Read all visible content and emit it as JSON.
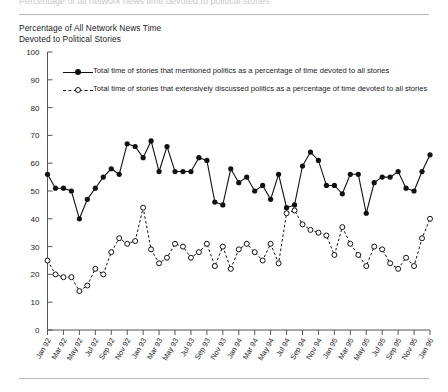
{
  "figure": {
    "clipped_header": "Percentage of all network news time devoted to political stories",
    "title": "Percentage of All Network News Time\nDevoted to Political Stories"
  },
  "chart_data": {
    "type": "line",
    "title": "Percentage of All Network News Time Devoted to Political Stories",
    "xlabel": "",
    "ylabel": "",
    "ylim": [
      0,
      100
    ],
    "ytick_step": 10,
    "yticks": [
      0,
      10,
      20,
      30,
      40,
      50,
      60,
      70,
      80,
      90,
      100
    ],
    "grid": false,
    "legend_position": "top-left",
    "x_tick_interval_months": 2,
    "x": [
      "Jan 92",
      "Feb 92",
      "Mar 92",
      "Apr 92",
      "May 92",
      "Jun 92",
      "Jul 92",
      "Aug 92",
      "Sep 92",
      "Oct 92",
      "Nov 92",
      "Dec 92",
      "Jan 93",
      "Feb 93",
      "Mar 93",
      "Apr 93",
      "May 93",
      "Jun 93",
      "Jul 93",
      "Aug 93",
      "Sep 93",
      "Oct 93",
      "Nov 93",
      "Dec 93",
      "Jan 94",
      "Feb 94",
      "Mar 94",
      "Apr 94",
      "May 94",
      "Jun 94",
      "Jul 94",
      "Aug 94",
      "Sep 94",
      "Oct 94",
      "Nov 94",
      "Dec 94",
      "Jan 95",
      "Feb 95",
      "Mar 95",
      "Apr 95",
      "May 95",
      "Jun 95",
      "Jul 95",
      "Aug 95",
      "Sep 95",
      "Oct 95",
      "Nov 95",
      "Dec 95",
      "Jan 96"
    ],
    "xticklabels": [
      "Jan 92",
      "Mar 92",
      "May 92",
      "Jul 92",
      "Sep 92",
      "Nov 92",
      "Jan 93",
      "Mar 93",
      "May 93",
      "Jul 93",
      "Sep 93",
      "Nov 93",
      "Jan 94",
      "Mar 94",
      "May 94",
      "Jul 94",
      "Sep 94",
      "Nov 94",
      "Jan 95",
      "Mar 95",
      "May 95",
      "Jul 95",
      "Sep 95",
      "Nov 95",
      "Jan 96"
    ],
    "series": [
      {
        "name": "Total time of stories that mentioned politics as a percentage of time devoted to all stories",
        "marker": "filled-circle",
        "linestyle": "solid",
        "values": [
          56,
          51,
          51,
          50,
          40,
          47,
          51,
          55,
          58,
          56,
          67,
          66,
          62,
          68,
          57,
          66,
          57,
          57,
          57,
          62,
          61,
          46,
          45,
          58,
          53,
          55,
          50,
          52,
          47,
          56,
          44,
          45,
          59,
          64,
          61,
          52,
          52,
          49,
          56,
          56,
          42,
          53,
          55,
          55,
          57,
          51,
          50,
          57,
          63
        ]
      },
      {
        "name": "Total time of stories that extensively discussed politics as a percentage of time devoted to all stories",
        "marker": "open-circle",
        "linestyle": "dashed",
        "values": [
          25,
          20,
          19,
          19,
          14,
          16,
          22,
          20,
          28,
          33,
          31,
          32,
          44,
          29,
          24,
          26,
          31,
          30,
          26,
          28,
          31,
          23,
          30,
          22,
          29,
          31,
          28,
          25,
          31,
          24,
          42,
          43,
          38,
          36,
          35,
          34,
          27,
          37,
          31,
          27,
          23,
          30,
          29,
          24,
          22,
          26,
          23,
          33,
          40
        ]
      }
    ]
  }
}
